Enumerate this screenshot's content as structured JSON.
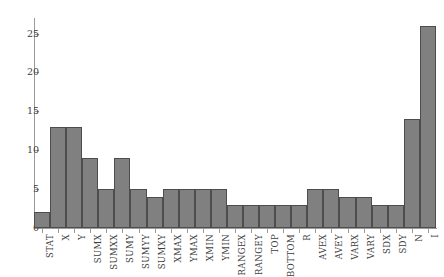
{
  "chart_data": {
    "type": "bar",
    "title": "",
    "subtitle": "",
    "xlabel": "",
    "ylabel": "",
    "xlim": [
      0,
      25
    ],
    "ylim": [
      0,
      27
    ],
    "yticks": [
      0,
      5,
      10,
      15,
      20,
      25
    ],
    "ytick_labels": [
      "0",
      "5",
      "10",
      "15",
      "20",
      "25"
    ],
    "grid": false,
    "legend": null,
    "bar_color": "#808080",
    "bar_edge_color": "#4d4d4d",
    "axis_color": "#9a9a9a",
    "text_color": "#3c3c3c",
    "background": "#ffffff",
    "categories": [
      "STAT",
      "X",
      "Y",
      "SUMX",
      "SUMXX",
      "SUMY",
      "SUMYY",
      "SUMXY",
      "XMAX",
      "YMAX",
      "XMIN",
      "YMIN",
      "RANGEX",
      "RANGEY",
      "TOP",
      "BOTTOM",
      "R",
      "AVEX",
      "AVEY",
      "VARX",
      "VARY",
      "SDX",
      "SDY",
      "N",
      "I"
    ],
    "values": [
      2,
      13,
      13,
      9,
      5,
      9,
      5,
      4,
      5,
      5,
      5,
      5,
      3,
      3,
      3,
      3,
      3,
      5,
      5,
      4,
      4,
      3,
      3,
      14,
      26
    ]
  }
}
